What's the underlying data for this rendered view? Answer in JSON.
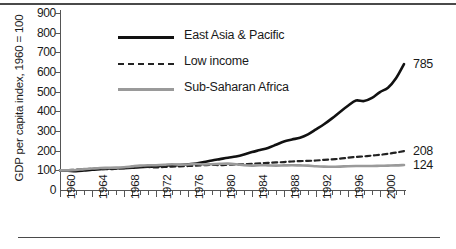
{
  "chart_data": {
    "type": "line",
    "title": "",
    "xlabel": "",
    "ylabel": "GDP per capita index, 1960 = 100",
    "xlim": [
      1960,
      2003
    ],
    "ylim": [
      0,
      900
    ],
    "grid": false,
    "legend_position": "top-left-inside",
    "y_ticks": [
      0,
      100,
      200,
      300,
      400,
      500,
      600,
      700,
      800,
      900
    ],
    "x_ticks": [
      1960,
      1964,
      1968,
      1972,
      1976,
      1980,
      1984,
      1988,
      1992,
      1996,
      2000
    ],
    "x_tick_labels": [
      "1960",
      "1964",
      "1968",
      "1972",
      "1976",
      "1980",
      "1984",
      "1988",
      "1992",
      "1996",
      "2000"
    ],
    "x_minor_tick_step": 1,
    "x": [
      1960,
      1961,
      1962,
      1963,
      1964,
      1965,
      1966,
      1967,
      1968,
      1969,
      1970,
      1971,
      1972,
      1973,
      1974,
      1975,
      1976,
      1977,
      1978,
      1979,
      1980,
      1981,
      1982,
      1983,
      1984,
      1985,
      1986,
      1987,
      1988,
      1989,
      1990,
      1991,
      1992,
      1993,
      1994,
      1995,
      1996,
      1997,
      1998,
      1999,
      2000,
      2001,
      2002,
      2003
    ],
    "series": [
      {
        "name": "East Asia & Pacific",
        "color": "#111111",
        "style": "solid",
        "end_label": "785",
        "end_value": 785,
        "values": [
          100,
          98,
          96,
          99,
          103,
          106,
          109,
          110,
          111,
          113,
          116,
          118,
          119,
          124,
          126,
          127,
          131,
          135,
          142,
          150,
          157,
          164,
          170,
          180,
          193,
          203,
          214,
          230,
          247,
          257,
          266,
          283,
          308,
          334,
          364,
          397,
          428,
          455,
          452,
          468,
          498,
          520,
          568,
          640
        ]
      },
      {
        "name": "Low income",
        "color": "#222222",
        "style": "dashed",
        "end_label": "208",
        "end_value": 208,
        "values": [
          100,
          101,
          103,
          105,
          108,
          107,
          106,
          108,
          111,
          114,
          117,
          117,
          115,
          117,
          119,
          120,
          122,
          124,
          126,
          128,
          126,
          128,
          130,
          131,
          133,
          136,
          138,
          140,
          142,
          145,
          147,
          148,
          150,
          153,
          156,
          159,
          164,
          168,
          171,
          175,
          179,
          184,
          190,
          198
        ]
      },
      {
        "name": "Sub-Saharan Africa",
        "color": "#9a9a9a",
        "style": "solid",
        "end_label": "124",
        "end_value": 124,
        "values": [
          100,
          100,
          102,
          106,
          109,
          112,
          113,
          114,
          116,
          120,
          124,
          126,
          126,
          128,
          131,
          129,
          130,
          132,
          130,
          131,
          133,
          134,
          131,
          126,
          124,
          126,
          125,
          124,
          125,
          126,
          125,
          124,
          121,
          119,
          118,
          119,
          121,
          122,
          122,
          122,
          123,
          124,
          125,
          127
        ]
      }
    ]
  },
  "axis": {
    "y_title": "GDP per capita index, 1960 = 100"
  },
  "legend": {
    "items": [
      {
        "label": "East Asia & Pacific"
      },
      {
        "label": "Low income"
      },
      {
        "label": "Sub-Saharan Africa"
      }
    ]
  }
}
